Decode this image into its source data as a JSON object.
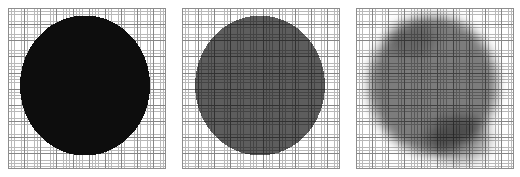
{
  "figure": {
    "title": "",
    "background_color": "#ffffff",
    "panel_count": 3,
    "panel_width_px": 158,
    "panel_height_px": 161
  },
  "grid": {
    "minor_color": "#b9b9b9",
    "major_color": "#868686",
    "border_color": "#8d8d8d",
    "minor_spacing_px": 3.23,
    "major_every_n_minor": 5,
    "minor_cells_across": 49,
    "minor_cells_down": 50
  },
  "panels": [
    {
      "id": "panel-1",
      "name": "binary-mask-panel",
      "label": "",
      "fill_color": "#0d0d0d",
      "edge_style": "pixelated-hard",
      "blur_px": 0,
      "opacity": 1.0,
      "circle": {
        "center_x_px": 77,
        "center_y_px": 77,
        "radius_x_px": 65,
        "radius_y_px": 70
      }
    },
    {
      "id": "panel-2",
      "name": "gray-mask-panel",
      "label": "",
      "fill_color": "#5d5d5d",
      "edge_style": "pixelated-hard",
      "blur_px": 0,
      "opacity": 0.8,
      "circle": {
        "center_x_px": 78,
        "center_y_px": 77,
        "radius_x_px": 65,
        "radius_y_px": 70
      }
    },
    {
      "id": "panel-3",
      "name": "blurred-mask-panel",
      "label": "",
      "fill_color": "#5f5f5f",
      "edge_style": "blurred-soft",
      "blur_px": 5.5,
      "opacity": 0.82,
      "circle": {
        "center_x_px": 77,
        "center_y_px": 77,
        "radius_x_px": 64,
        "radius_y_px": 69
      },
      "smudge": {
        "present": true,
        "position": "bottom-right",
        "color": "#4a4a4a",
        "opacity": 0.55
      }
    }
  ],
  "chart_data": {
    "type": "heatmap",
    "title": "",
    "subtitle": "",
    "xlabel": "",
    "ylabel": "",
    "grid": true,
    "legend": "none",
    "panel_titles": [
      "",
      "",
      ""
    ],
    "series": [
      {
        "name": "panel-1-binary",
        "fill_level": 0.95,
        "edge_softness": 0.0
      },
      {
        "name": "panel-2-gray",
        "fill_level": 0.64,
        "edge_softness": 0.0
      },
      {
        "name": "panel-3-blurred",
        "fill_level": 0.62,
        "edge_softness": 0.85
      }
    ],
    "categories": [
      "binary",
      "gray",
      "blurred"
    ],
    "values": [
      0.95,
      0.64,
      0.62
    ],
    "xlim": [
      0,
      49
    ],
    "ylim": [
      0,
      50
    ]
  }
}
